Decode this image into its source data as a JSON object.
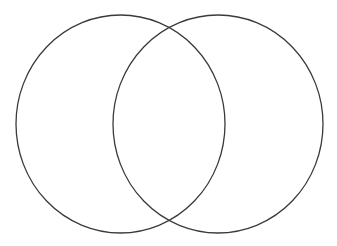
{
  "diagram": {
    "type": "venn",
    "background": "#ffffff",
    "stroke_color": "#3a3a3a",
    "stroke_width": 1.3,
    "sets": [
      {
        "id": "left",
        "label": "",
        "cx": 120.5,
        "cy": 124,
        "rx": 104.5,
        "ry": 109
      },
      {
        "id": "right",
        "label": "",
        "cx": 218,
        "cy": 124,
        "rx": 105,
        "ry": 109
      }
    ]
  }
}
